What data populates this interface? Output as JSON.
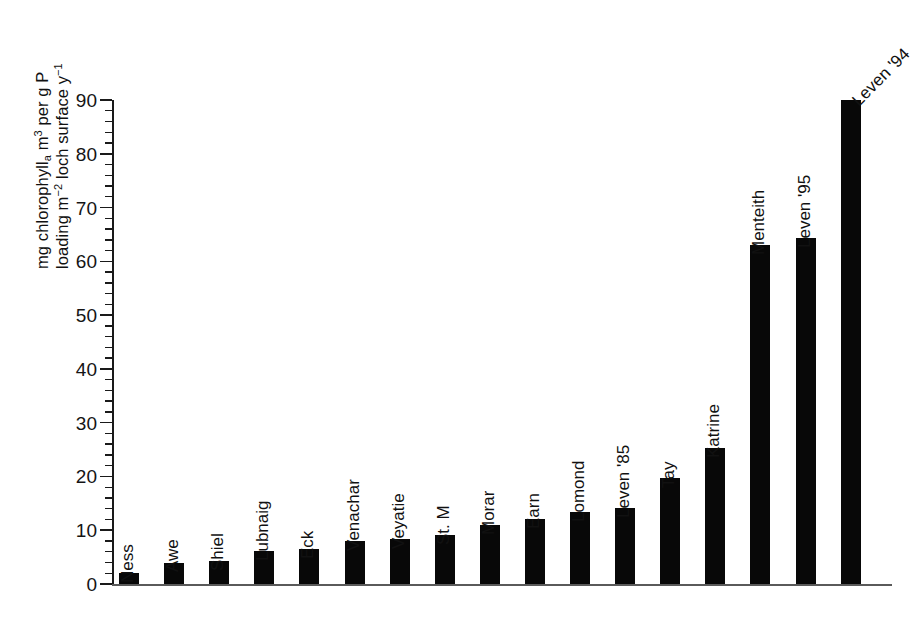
{
  "chart_data": {
    "type": "bar",
    "title": "",
    "subtitle": "",
    "xlabel": "",
    "ylabel_line1_html": "mg chlorophyll<sub>a</sub> m<sup>3</sup> per g P",
    "ylabel_line2_html": "loading m<sup>-2</sup> loch surface y<sup>-1</sup>",
    "ylabel_plain": "mg chlorophyll a m3 per g P loading m-2 loch surface y-1",
    "categories": [
      "Ness",
      "Awe",
      "Shiel",
      "Lubnaig",
      "Eck",
      "Venachar",
      "Veyatie",
      "St. M",
      "Morar",
      "Earn",
      "Lomond",
      "Leven '85",
      "Tay",
      "Katrine",
      "Menteith",
      "Leven '95",
      "Leven '94"
    ],
    "values": [
      2.0,
      4.0,
      4.2,
      6.2,
      6.6,
      8.0,
      8.3,
      9.2,
      11.0,
      12.0,
      13.3,
      14.1,
      19.8,
      25.2,
      63.0,
      64.3,
      90.0
    ],
    "ylim": [
      0,
      90
    ],
    "y_major_ticks": [
      0,
      10,
      20,
      30,
      40,
      50,
      60,
      70,
      80,
      90
    ],
    "y_minor_tick_step": 2,
    "grid": false,
    "legend": "none",
    "bar_color": "#080808",
    "axis_color": "#1a1a1a",
    "background_color": "#ffffff",
    "label_rotation_deg": 90,
    "last_label_rotation_deg": 45
  },
  "axis": {
    "tick_labels": [
      "0",
      "10",
      "20",
      "30",
      "40",
      "50",
      "60",
      "70",
      "80",
      "90"
    ]
  }
}
